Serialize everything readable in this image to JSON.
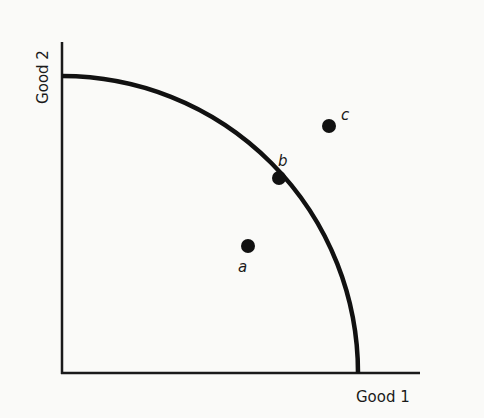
{
  "diagram": {
    "type": "production possibilities frontier",
    "axes": {
      "x_label": "Good 1",
      "y_label": "Good 2"
    },
    "curve": {
      "shape": "concave quarter-ellipse",
      "color": "#111111"
    },
    "points": [
      {
        "id": "a",
        "label": "a",
        "position": "inside frontier"
      },
      {
        "id": "b",
        "label": "b",
        "position": "on frontier"
      },
      {
        "id": "c",
        "label": "c",
        "position": "outside frontier"
      }
    ]
  }
}
